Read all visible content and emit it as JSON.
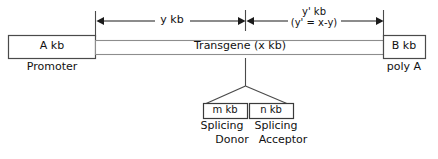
{
  "figure": {
    "type": "diagram",
    "background_color": "#ffffff",
    "line_color": "#3a3a3a",
    "text_color": "#111111"
  },
  "main_construct": {
    "promoter_box": {
      "value": "A  kb",
      "caption": "Promoter"
    },
    "transgene_bar": {
      "value": "Transgene (x kb)"
    },
    "polya_box": {
      "value": "B  kb",
      "caption": "poly A"
    }
  },
  "measurements": {
    "left_span": {
      "label": "y  kb"
    },
    "right_span": {
      "label_line1": "y' kb",
      "label_line2": "(y' = x-y)"
    }
  },
  "splice_sites": {
    "donor": {
      "box_value": "m kb",
      "caption_line1": "Splicing",
      "caption_line2": "Donor"
    },
    "acceptor": {
      "box_value": "n kb",
      "caption_line1": "Splicing",
      "caption_line2": "Acceptor"
    }
  }
}
